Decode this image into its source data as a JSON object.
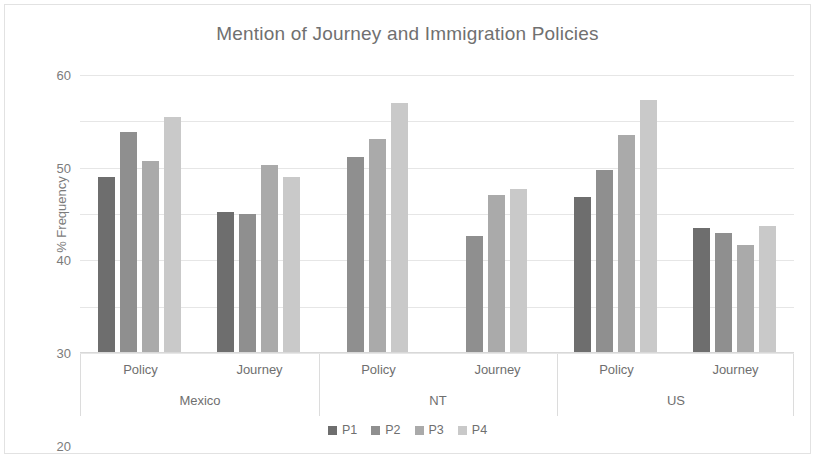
{
  "chart_data": {
    "type": "bar",
    "title": "Mention of Journey and Immigration Policies",
    "xlabel": "",
    "ylabel": "% Frequency",
    "ylim": [
      0,
      60
    ],
    "yticks": [
      0,
      10,
      20,
      30,
      40,
      50,
      60
    ],
    "grid": true,
    "legend_position": "bottom",
    "groups": [
      {
        "label": "Mexico",
        "subgroups": [
          {
            "label": "Policy",
            "values": [
              38.0,
              47.8,
              41.5,
              51.0
            ]
          },
          {
            "label": "Journey",
            "values": [
              30.4,
              30.0,
              40.5,
              38.0
            ]
          }
        ]
      },
      {
        "label": "NT",
        "subgroups": [
          {
            "label": "Policy",
            "values": [
              null,
              42.2,
              46.2,
              53.9
            ]
          },
          {
            "label": "Journey",
            "values": [
              null,
              25.3,
              34.2,
              35.4
            ]
          }
        ]
      },
      {
        "label": "US",
        "subgroups": [
          {
            "label": "Policy",
            "values": [
              33.7,
              39.5,
              47.0,
              54.5
            ]
          },
          {
            "label": "Journey",
            "values": [
              27.0,
              26.0,
              23.3,
              27.5
            ]
          }
        ]
      }
    ],
    "series": [
      {
        "name": "P1",
        "color": "#6e6e6e"
      },
      {
        "name": "P2",
        "color": "#8f8f8f"
      },
      {
        "name": "P3",
        "color": "#aaaaaa"
      },
      {
        "name": "P4",
        "color": "#c9c9c9"
      }
    ]
  }
}
